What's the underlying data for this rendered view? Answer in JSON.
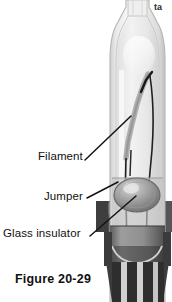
{
  "page": {
    "background_color": "#ffffff",
    "clipped_text_fragment": "ta"
  },
  "figure": {
    "caption": "Figure 20-29",
    "orientation": "vertical"
  },
  "callouts": [
    {
      "id": "filament",
      "label": "Filament",
      "leader": "up-right"
    },
    {
      "id": "jumper",
      "label": "Jumper",
      "leader": "up-right"
    },
    {
      "id": "glass-insulator",
      "label": "Glass insulator",
      "leader": "up-right"
    }
  ],
  "colors": {
    "ink": "#111111",
    "glass_light": "#f1f1f1",
    "glass_mid": "#e2e2e2",
    "glass_edge": "#b9b9b9",
    "glass_highlight": "#fbfbfb",
    "insulator_dark": "#7b7b7b",
    "insulator_mid": "#9a9a9a",
    "insulator_highlight": "#d9d9d9",
    "base_metal": "#8e8e8e",
    "base_metal_dark": "#5a5a5a",
    "base_shell": "#4a4a4a",
    "pin_dark": "#3b3b3b",
    "pin_light": "#c9c9c9",
    "wire": "#1a1a1a"
  }
}
